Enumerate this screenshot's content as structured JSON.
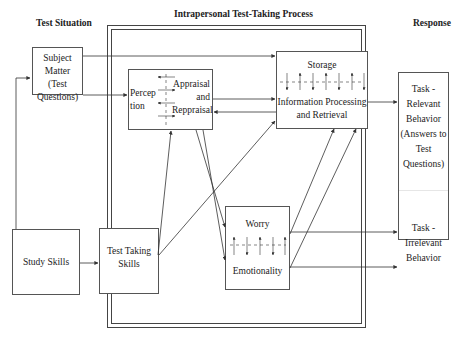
{
  "headers": {
    "test_situation": "Test Situation",
    "process": "Intrapersonal  Test-Taking Process",
    "response": "Response"
  },
  "nodes": {
    "subject_matter": "Subject Matter (Test Questions)",
    "subject_matter_lines": [
      "Subject",
      "Matter",
      "(Test",
      "Questions)"
    ],
    "study_skills": "Study Skills",
    "test_taking_skills_lines": [
      "Test Taking",
      "Skills"
    ],
    "perception_lines": [
      "Percep",
      "tion"
    ],
    "appraisal_lines": [
      "Appraisal",
      "and",
      "Reppraisal"
    ],
    "storage": "Storage",
    "info_processing_lines": [
      "Information Processing",
      "and Retrieval"
    ],
    "worry": "Worry",
    "emotionality": "Emotionality",
    "task_relevant_lines": [
      "Task -",
      "Relevant",
      "Behavior",
      "(Answers to",
      "Test",
      "Questions)"
    ],
    "task_irrelevant_lines": [
      "Task -",
      "Irrelevant",
      "Behavior"
    ]
  },
  "colors": {
    "line": "#333333",
    "border": "#555555"
  }
}
